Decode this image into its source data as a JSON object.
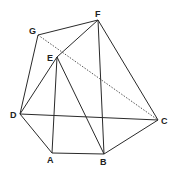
{
  "diagram": {
    "type": "geometric-figure",
    "points": {
      "A": {
        "label": "A",
        "x": 52,
        "y": 153,
        "lx": 47,
        "ly": 163
      },
      "B": {
        "label": "B",
        "x": 104,
        "y": 154,
        "lx": 100,
        "ly": 165
      },
      "C": {
        "label": "C",
        "x": 158,
        "y": 120,
        "lx": 161,
        "ly": 124
      },
      "D": {
        "label": "D",
        "x": 20,
        "y": 114,
        "lx": 10,
        "ly": 118
      },
      "E": {
        "label": "E",
        "x": 57,
        "y": 57,
        "lx": 47,
        "ly": 61
      },
      "F": {
        "label": "F",
        "x": 98,
        "y": 20,
        "lx": 95,
        "ly": 17
      },
      "G": {
        "label": "G",
        "x": 38,
        "y": 35,
        "lx": 29,
        "ly": 34
      }
    },
    "edges": [
      {
        "from": "G",
        "to": "F",
        "style": "solid"
      },
      {
        "from": "G",
        "to": "D",
        "style": "solid"
      },
      {
        "from": "G",
        "to": "C",
        "style": "dotted"
      },
      {
        "from": "F",
        "to": "E",
        "style": "solid"
      },
      {
        "from": "F",
        "to": "B",
        "style": "solid"
      },
      {
        "from": "F",
        "to": "C",
        "style": "solid"
      },
      {
        "from": "E",
        "to": "D",
        "style": "solid"
      },
      {
        "from": "E",
        "to": "A",
        "style": "solid"
      },
      {
        "from": "E",
        "to": "B",
        "style": "solid"
      },
      {
        "from": "D",
        "to": "C",
        "style": "solid"
      },
      {
        "from": "D",
        "to": "A",
        "style": "solid"
      },
      {
        "from": "A",
        "to": "B",
        "style": "solid"
      },
      {
        "from": "B",
        "to": "C",
        "style": "solid"
      }
    ],
    "colors": {
      "line": "#2a2a2a",
      "label": "#222222",
      "background": "#ffffff"
    }
  }
}
